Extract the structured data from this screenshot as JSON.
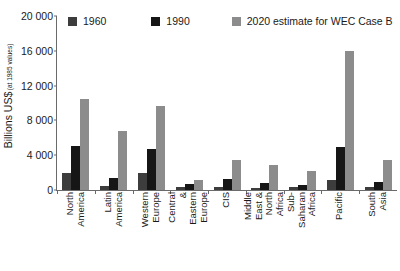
{
  "chart_data": {
    "type": "bar",
    "title": "",
    "xlabel": "",
    "ylabel": "Billions US$",
    "ylabel_sub": "(at 1985 values)",
    "ylim": [
      0,
      20000
    ],
    "yticks": [
      0,
      4000,
      8000,
      12000,
      16000,
      20000
    ],
    "ytick_labels": [
      "0",
      "4 000",
      "8 000",
      "12 000",
      "16 000",
      "20 000"
    ],
    "grid": false,
    "legend_position": "top",
    "categories": [
      "North\nAmerica",
      "Latin\nAmerica",
      "Western\nEurope",
      "Central &\nEastern\nEurope",
      "CIS",
      "Middle East &\nNorth Africa",
      "Sub-Saharan\nAfrica",
      "Pacific",
      "South\nAsia"
    ],
    "series": [
      {
        "name": "1960",
        "color": "#3d3d3d",
        "values": [
          2000,
          500,
          1900,
          300,
          400,
          250,
          300,
          1200,
          300
        ]
      },
      {
        "name": "1990",
        "color": "#161616",
        "values": [
          5100,
          1400,
          4700,
          700,
          1300,
          800,
          550,
          4900,
          900
        ]
      },
      {
        "name": "2020 estimate for WEC Case B",
        "color": "#8c8c8c",
        "values": [
          10500,
          6800,
          9700,
          1100,
          3400,
          2900,
          2200,
          16000,
          3400
        ]
      }
    ]
  },
  "legend": {
    "items": [
      {
        "label": "1960",
        "color": "#3d3d3d"
      },
      {
        "label": "1990",
        "color": "#161616"
      },
      {
        "label": "2020 estimate for WEC Case B",
        "color": "#8c8c8c"
      }
    ]
  },
  "colors": {
    "axis": "#6a6a6a",
    "text": "#1a1a1a",
    "background": "#ffffff"
  }
}
